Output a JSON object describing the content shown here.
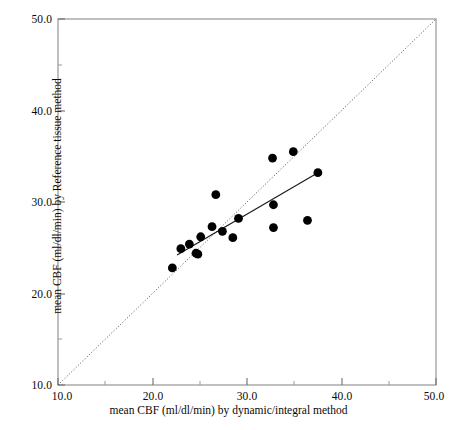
{
  "chart_data": {
    "type": "scatter",
    "title": "",
    "xlabel": "mean CBF (ml/dl/min) by dynamic/integral method",
    "ylabel": "mean CBF (ml/dl/min) by Reference tissue method",
    "xlim": [
      10.0,
      50.0
    ],
    "ylim": [
      10.0,
      50.0
    ],
    "xticks": [
      "10.0",
      "20.0",
      "30.0",
      "40.0",
      "50.0"
    ],
    "yticks": [
      "10.0",
      "20.0",
      "30.0",
      "40.0",
      "50.0"
    ],
    "xtick_values": [
      10.0,
      20.0,
      30.0,
      40.0,
      50.0
    ],
    "ytick_values": [
      10.0,
      20.0,
      30.0,
      40.0,
      50.0
    ],
    "minor_ticks": true,
    "grid": false,
    "legend": null,
    "marker": "filled-circle",
    "marker_color": "#000000",
    "points": [
      {
        "x": 22.1,
        "y": 22.8
      },
      {
        "x": 23.0,
        "y": 24.9
      },
      {
        "x": 23.9,
        "y": 25.4
      },
      {
        "x": 24.6,
        "y": 24.4
      },
      {
        "x": 24.8,
        "y": 24.3
      },
      {
        "x": 25.1,
        "y": 26.2
      },
      {
        "x": 26.3,
        "y": 27.3
      },
      {
        "x": 26.7,
        "y": 30.8
      },
      {
        "x": 27.4,
        "y": 26.8
      },
      {
        "x": 28.5,
        "y": 26.1
      },
      {
        "x": 29.1,
        "y": 28.2
      },
      {
        "x": 32.7,
        "y": 34.8
      },
      {
        "x": 32.8,
        "y": 29.7
      },
      {
        "x": 32.8,
        "y": 27.2
      },
      {
        "x": 34.9,
        "y": 35.5
      },
      {
        "x": 36.4,
        "y": 28.0
      },
      {
        "x": 37.5,
        "y": 33.2
      }
    ],
    "identity_line": {
      "label": "line of identity",
      "style": "dotted",
      "from": {
        "x": 10.0,
        "y": 10.0
      },
      "to": {
        "x": 50.0,
        "y": 50.0
      }
    },
    "regression_line": {
      "label": "regression line",
      "style": "solid",
      "from": {
        "x": 22.6,
        "y": 24.2
      },
      "to": {
        "x": 37.5,
        "y": 33.2
      }
    }
  }
}
